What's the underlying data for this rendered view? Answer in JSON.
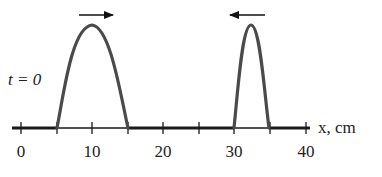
{
  "figure": {
    "time_label": "t = 0",
    "axis_label": "x, cm",
    "tick_labels": [
      "0",
      "10",
      "20",
      "30",
      "40"
    ],
    "axis": {
      "x_min_cm": 0,
      "x_max_cm": 40,
      "major_ticks_cm": [
        0,
        10,
        20,
        30,
        40
      ],
      "minor_ticks_cm": [
        5,
        15,
        25,
        35
      ]
    },
    "pulses": [
      {
        "name": "left-pulse",
        "start_cm": 5,
        "end_cm": 15,
        "peak_cm": 10,
        "direction": "right",
        "arrow_icon": "arrow-right-icon"
      },
      {
        "name": "right-pulse",
        "start_cm": 30,
        "end_cm": 35,
        "peak_cm": 32.5,
        "direction": "left",
        "arrow_icon": "arrow-left-icon"
      }
    ],
    "colors": {
      "curve": "#4a4a4a",
      "axis": "#1a1a1a",
      "text": "#222222"
    }
  }
}
